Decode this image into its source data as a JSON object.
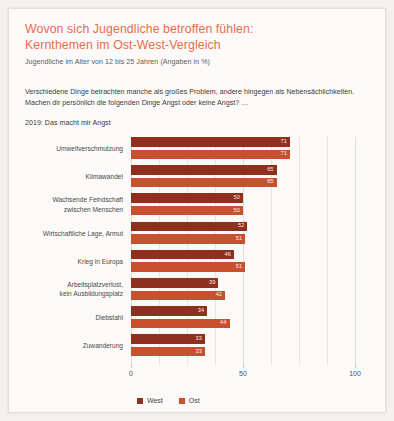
{
  "title": {
    "line1": "Wovon sich Jugendliche betroffen fühlen:",
    "line2": "Kernthemen im Ost-West-Vergleich",
    "color": "#ec6a4d"
  },
  "subtitle": "Jugendliche im Alter von 12 bis 25 Jahren (Angaben in %)",
  "intro": {
    "line1": "Verschiedene Dinge betrachten manche als großes Problem, andere hingegen als Nebensächlichkeiten.",
    "line2": "Machen dir persönlich die folgenden Dinge Angst oder keine Angst? …"
  },
  "series_note": "2019: Das macht mir Angst",
  "legend": {
    "items": [
      {
        "label": "West",
        "color": "#8f2f1d"
      },
      {
        "label": "Ost",
        "color": "#c8502f"
      }
    ]
  },
  "chart_data": {
    "type": "bar",
    "orientation": "horizontal",
    "title": "Wovon sich Jugendliche betroffen fühlen: Kernthemen im Ost-West-Vergleich",
    "subtitle": "Jugendliche im Alter von 12 bis 25 Jahren (Angaben in %)",
    "xlabel": "",
    "ylabel": "",
    "xlim": [
      0,
      100
    ],
    "xticks": [
      0,
      50,
      100
    ],
    "xticklabels": [
      "0",
      "50",
      "100"
    ],
    "grid": true,
    "legend_position": "bottom",
    "categories": [
      "Umweltverschmutzung",
      "Klimawandel",
      "Wachsende Feindschaft zwischen Menschen",
      "Wirtschaftliche Lage, Armut",
      "Krieg in Europa",
      "Arbeitsplatzverlust, kein Ausbildungsplatz",
      "Diebstahl",
      "Zuwanderung"
    ],
    "category_lines": [
      [
        "Umweltverschmutzung"
      ],
      [
        "Klimawandel"
      ],
      [
        "Wachsende Feindschaft",
        "zwischen Menschen"
      ],
      [
        "Wirtschaftliche Lage, Armut"
      ],
      [
        "Krieg in Europa"
      ],
      [
        "Arbeitsplatzverlust,",
        "kein Ausbildungsplatz"
      ],
      [
        "Diebstahl"
      ],
      [
        "Zuwanderung"
      ]
    ],
    "series": [
      {
        "name": "West",
        "color": "#8f2f1d",
        "values": [
          71,
          65,
          50,
          52,
          46,
          39,
          34,
          33
        ]
      },
      {
        "name": "Ost",
        "color": "#c8502f",
        "values": [
          71,
          65,
          50,
          51,
          51,
          42,
          44,
          33
        ]
      }
    ]
  }
}
